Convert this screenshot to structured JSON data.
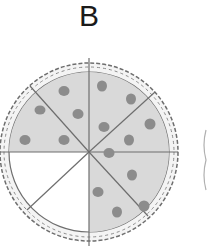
{
  "figure": {
    "label": "B",
    "slices_total": 8,
    "slices_shaded": 6,
    "slices_unshaded": 2,
    "colors": {
      "shaded_fill": "#d9d9d9",
      "unshaded_fill": "#ffffff",
      "pepperoni": "#8c8c8c",
      "line": "#6e6e6e",
      "crust_fill": "#f4f4f4"
    }
  }
}
